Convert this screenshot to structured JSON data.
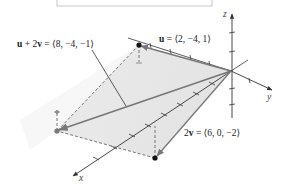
{
  "figure": {
    "type": "3d-vector-diagram",
    "axes": {
      "x_label": "x",
      "y_label": "y",
      "z_label": "z"
    },
    "vectors": [
      {
        "name": "u",
        "label_bold": "u",
        "label_rest": " = ⟨2, −4, 1⟩",
        "components": [
          2,
          -4,
          1
        ]
      },
      {
        "name": "2v",
        "label_bold": "2v",
        "label_prefix": "2",
        "label_bold_part": "v",
        "label_rest": " = ⟨6, 0, −2⟩",
        "components": [
          6,
          0,
          -2
        ]
      },
      {
        "name": "u+2v",
        "label_rest": " = ⟨8, −4, −1⟩",
        "components": [
          8,
          -4,
          -1
        ]
      }
    ],
    "labels": {
      "u_bold": "u",
      "u_value": " = ⟨2, −4, 1⟩",
      "v2_prefix": "2",
      "v2_bold": "v",
      "v2_value": " = ⟨6, 0, −2⟩",
      "sum_u": "u",
      "sum_plus": " + 2",
      "sum_v": "v",
      "sum_value": " = ⟨8, −4, −1⟩"
    },
    "colors": {
      "axis": "#333333",
      "vector": "#777777",
      "plane_shade": "#e6e6e6",
      "point": "#111111",
      "point_sum": "#777777"
    }
  }
}
